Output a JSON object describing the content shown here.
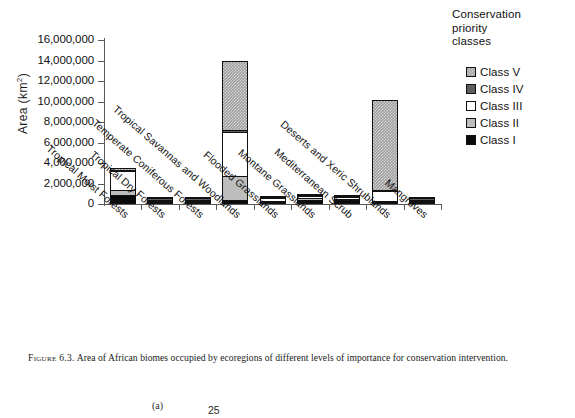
{
  "figure": {
    "caption_number": "Figure 6.3.",
    "caption_text": "Area of African biomes occupied by ecoregions of different levels of importance for conservation intervention."
  },
  "legend": {
    "title": "Conservation priority classes",
    "title_line1": "Conservation",
    "title_line2": "priority",
    "title_line3": "classes",
    "items": [
      {
        "label": "Class V",
        "swatch": "class-v-swatch",
        "color": "#9e9e9e"
      },
      {
        "label": "Class IV",
        "swatch": "class-iv-swatch",
        "color": "#5e5e5e"
      },
      {
        "label": "Class III",
        "swatch": "class-iii-swatch",
        "color": "#ffffff"
      },
      {
        "label": "Class II",
        "swatch": "class-ii-swatch",
        "color": "#bdbdbd"
      },
      {
        "label": "Class I",
        "swatch": "class-i-swatch",
        "color": "#0a0a0a"
      }
    ]
  },
  "next_figure_fragment": {
    "panel_label": "(a)",
    "axis_value": "25"
  },
  "chart_data": {
    "type": "bar",
    "stacked": true,
    "title": "",
    "xlabel": "",
    "ylabel": "Area (km2)",
    "ylabel_display": "Area (km",
    "ylabel_superscript": "2",
    "ylabel_suffix": ")",
    "ylim": [
      0,
      16000000
    ],
    "ytick_step": 2000000,
    "ytick_labels": [
      "16,000,000",
      "14,000,000",
      "12,000,000",
      "10,000,000",
      "8,000,000",
      "6,000,000",
      "4,000,000",
      "2,000,000",
      "0"
    ],
    "ytick_values": [
      16000000,
      14000000,
      12000000,
      10000000,
      8000000,
      6000000,
      4000000,
      2000000,
      0
    ],
    "grid": false,
    "legend_position": "right",
    "categories": [
      "Tropical Moist Forests",
      "Tropical Dry Forests",
      "Temperate Coniferous Forests",
      "Tropical Savannas and Woodlands",
      "Flooded Grasslands",
      "Montane Grasslands",
      "Mediterranean Scrub",
      "Deserts and Xeric Shrublands",
      "Mangroves"
    ],
    "series": [
      {
        "name": "Class I",
        "fill": "fill-c1",
        "values": [
          900000,
          150000,
          10000,
          350000,
          30000,
          400000,
          380000,
          40000,
          40000
        ]
      },
      {
        "name": "Class II",
        "fill": "fill-c2",
        "values": [
          500000,
          20000,
          5000,
          2350000,
          60000,
          200000,
          120000,
          20000,
          10000
        ]
      },
      {
        "name": "Class III",
        "fill": "fill-c3",
        "values": [
          1800000,
          20000,
          5000,
          4300000,
          280000,
          150000,
          180000,
          930000,
          15000
        ]
      },
      {
        "name": "Class IV",
        "fill": "fill-c4",
        "values": [
          100000,
          10000,
          2000,
          180000,
          20000,
          30000,
          30000,
          30000,
          5000
        ]
      },
      {
        "name": "Class V",
        "fill": "fill-c5",
        "values": [
          200000,
          10000,
          2000,
          6820000,
          30000,
          20000,
          20000,
          8780000,
          5000
        ]
      }
    ],
    "totals": [
      3500000,
      210000,
      24000,
      14000000,
      420000,
      800000,
      730000,
      9800000,
      75000
    ]
  }
}
